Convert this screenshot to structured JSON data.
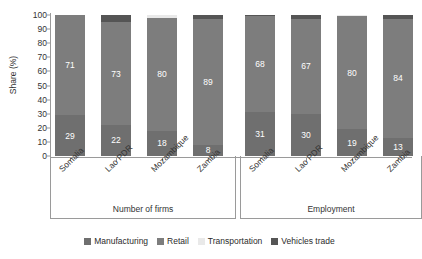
{
  "chart_data": {
    "type": "bar",
    "subtype": "stacked-100-percent",
    "title": "",
    "xlabel": "",
    "ylabel": "Share (%)",
    "ylim": [
      0,
      100
    ],
    "yticks": [
      0,
      10,
      20,
      30,
      40,
      50,
      60,
      70,
      80,
      90,
      100
    ],
    "grid": false,
    "legend_position": "bottom",
    "legend": [
      "Manufacturing",
      "Retail",
      "Transportation",
      "Vehicles trade"
    ],
    "series_colors": {
      "Manufacturing": "#6f6f6f",
      "Retail": "#7d7d7d",
      "Transportation": "#e9e9e9",
      "Vehicles trade": "#555555"
    },
    "groups": [
      {
        "name": "Number of firms",
        "categories": [
          "Somalia",
          "Lao PDR",
          "Mozambique",
          "Zambia"
        ],
        "series": [
          {
            "name": "Manufacturing",
            "values": [
              29,
              22,
              18,
              8
            ]
          },
          {
            "name": "Retail",
            "values": [
              71,
              73,
              80,
              89
            ]
          },
          {
            "name": "Transportation",
            "values": [
              0,
              0,
              2,
              0
            ]
          },
          {
            "name": "Vehicles trade",
            "values": [
              0,
              5,
              0,
              3
            ]
          }
        ]
      },
      {
        "name": "Employment",
        "categories": [
          "Somalia",
          "Lao PDR",
          "Mozambique",
          "Zambia"
        ],
        "series": [
          {
            "name": "Manufacturing",
            "values": [
              31,
              30,
              19,
              13
            ]
          },
          {
            "name": "Retail",
            "values": [
              68,
              67,
              80,
              84
            ]
          },
          {
            "name": "Transportation",
            "values": [
              0,
              0,
              1,
              0
            ]
          },
          {
            "name": "Vehicles trade",
            "values": [
              1,
              3,
              0,
              3
            ]
          }
        ]
      }
    ],
    "data_labels": {
      "Number of firms": {
        "Somalia": {
          "Manufacturing": "29",
          "Retail": "71"
        },
        "Lao PDR": {
          "Manufacturing": "22",
          "Retail": "73"
        },
        "Mozambique": {
          "Manufacturing": "18",
          "Retail": "80"
        },
        "Zambia": {
          "Manufacturing": "8",
          "Retail": "89"
        }
      },
      "Employment": {
        "Somalia": {
          "Manufacturing": "31",
          "Retail": "68"
        },
        "Lao PDR": {
          "Manufacturing": "30",
          "Retail": "67"
        },
        "Mozambique": {
          "Manufacturing": "19",
          "Retail": "80"
        },
        "Zambia": {
          "Manufacturing": "13",
          "Retail": "84"
        }
      }
    }
  }
}
